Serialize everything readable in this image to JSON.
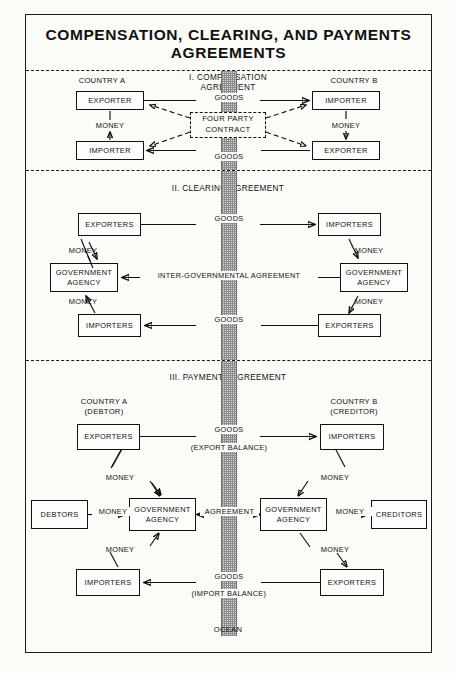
{
  "title": "COMPENSATION, CLEARING, AND PAYMENTS AGREEMENTS",
  "ocean_label": "OCEAN",
  "sections": [
    {
      "id": "compensation",
      "heading_line1": "I. COMPENSATION",
      "heading_line2": "AGREEMENT",
      "country_left": "COUNTRY A",
      "country_right": "COUNTRY B",
      "boxes": {
        "left_top": "EXPORTER",
        "left_bottom": "IMPORTER",
        "right_top": "IMPORTER",
        "right_bottom": "EXPORTER",
        "center_line1": "FOUR PARTY",
        "center_line2": "CONTRACT"
      },
      "labels": {
        "goods_top": "GOODS",
        "goods_bottom": "GOODS",
        "money_left": "MONEY",
        "money_right": "MONEY"
      }
    },
    {
      "id": "clearing",
      "heading_line1": "II. CLEARING AGREEMENT",
      "boxes": {
        "left_top": "EXPORTERS",
        "left_mid_line1": "GOVERNMENT",
        "left_mid_line2": "AGENCY",
        "left_bottom": "IMPORTERS",
        "right_top": "IMPORTERS",
        "right_mid_line1": "GOVERNMENT",
        "right_mid_line2": "AGENCY",
        "right_bottom": "EXPORTERS"
      },
      "labels": {
        "goods_top": "GOODS",
        "goods_bottom": "GOODS",
        "agreement": "INTER-GOVERNMENTAL AGREEMENT",
        "money_left_top": "MONEY",
        "money_left_bottom": "MONEY",
        "money_right_top": "MONEY",
        "money_right_bottom": "MONEY"
      }
    },
    {
      "id": "payments",
      "heading_line1": "III. PAYMENTS AGREEMENT",
      "country_left_line1": "COUNTRY A",
      "country_left_line2": "(DEBTOR)",
      "country_right_line1": "COUNTRY B",
      "country_right_line2": "(CREDITOR)",
      "boxes": {
        "left_top": "EXPORTERS",
        "left_mid_line1": "GOVERNMENT",
        "left_mid_line2": "AGENCY",
        "left_bottom": "IMPORTERS",
        "right_top": "IMPORTERS",
        "right_mid_line1": "GOVERNMENT",
        "right_mid_line2": "AGENCY",
        "right_bottom": "EXPORTERS",
        "far_left": "DEBTORS",
        "far_right": "CREDITORS"
      },
      "labels": {
        "goods_top": "GOODS",
        "goods_top_sub": "(EXPORT BALANCE)",
        "goods_bottom": "GOODS",
        "goods_bottom_sub": "(IMPORT BALANCE)",
        "agreement": "AGREEMENT",
        "money_debtors": "MONEY",
        "money_creditors": "MONEY",
        "money_left_top": "MONEY",
        "money_left_bottom": "MONEY",
        "money_right_top": "MONEY",
        "money_right_bottom": "MONEY"
      }
    }
  ]
}
